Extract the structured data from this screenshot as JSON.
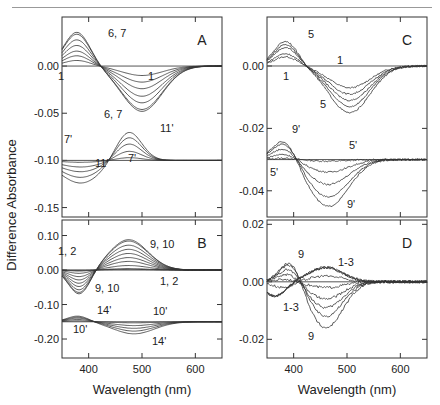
{
  "figure": {
    "ylabel": "Difference Absorbance",
    "xlabel": "Wavelength (nm)"
  },
  "chart_data": [
    {
      "panel": "A",
      "type": "line",
      "xlabel": "Wavelength (nm)",
      "ylabel": "Difference Absorbance",
      "xlim": [
        350,
        650
      ],
      "ylim": [
        -0.16,
        0.052
      ],
      "xticks": [
        400,
        500,
        600
      ],
      "yticks": [
        0.0,
        -0.05,
        -0.1,
        -0.15
      ],
      "ytick_labels": [
        "0.00",
        "-0.05",
        "-0.10",
        "-0.15"
      ],
      "baselines": [
        0.0,
        -0.1
      ],
      "groups": [
        {
          "name": "spectra 1 to 7",
          "offset": 0.0,
          "series": [
            {
              "name": "1",
              "peak_nm": 378,
              "peak": 0.006,
              "trough_nm": 500,
              "trough": -0.01
            },
            {
              "name": "2",
              "peak_nm": 378,
              "peak": 0.011,
              "trough_nm": 500,
              "trough": -0.017
            },
            {
              "name": "3",
              "peak_nm": 378,
              "peak": 0.016,
              "trough_nm": 500,
              "trough": -0.024
            },
            {
              "name": "4",
              "peak_nm": 378,
              "peak": 0.022,
              "trough_nm": 500,
              "trough": -0.032
            },
            {
              "name": "5",
              "peak_nm": 378,
              "peak": 0.028,
              "trough_nm": 500,
              "trough": -0.039
            },
            {
              "name": "6",
              "peak_nm": 378,
              "peak": 0.034,
              "trough_nm": 500,
              "trough": -0.046
            },
            {
              "name": "7",
              "peak_nm": 378,
              "peak": 0.036,
              "trough_nm": 500,
              "trough": -0.048
            }
          ]
        },
        {
          "name": "spectra 7' to 11'",
          "offset": -0.1,
          "series": [
            {
              "name": "7'",
              "trough_nm": 385,
              "trough": -0.002,
              "peak_nm": 475,
              "peak": 0.003
            },
            {
              "name": "8'",
              "trough_nm": 385,
              "trough": -0.007,
              "peak_nm": 475,
              "peak": 0.01
            },
            {
              "name": "9'",
              "trough_nm": 385,
              "trough": -0.012,
              "peak_nm": 475,
              "peak": 0.018
            },
            {
              "name": "10'",
              "trough_nm": 385,
              "trough": -0.018,
              "peak_nm": 475,
              "peak": 0.025
            },
            {
              "name": "11'",
              "trough_nm": 385,
              "trough": -0.024,
              "peak_nm": 475,
              "peak": 0.031
            }
          ]
        }
      ],
      "annotations": [
        "6, 7",
        "1",
        "1",
        "6, 7",
        "7'",
        "11'",
        "11'",
        "7'"
      ]
    },
    {
      "panel": "B",
      "type": "line",
      "xlabel": "Wavelength (nm)",
      "ylabel": "Difference Absorbance",
      "xlim": [
        350,
        650
      ],
      "ylim": [
        -0.255,
        0.145
      ],
      "xticks": [
        400,
        500,
        600
      ],
      "xtick_labels": [
        "400",
        "500",
        "600"
      ],
      "yticks": [
        0.1,
        0.0,
        -0.1,
        -0.2
      ],
      "ytick_labels": [
        "0.10",
        "0.00",
        "-0.10",
        "-0.20"
      ],
      "baselines": [
        0.0,
        -0.15
      ],
      "groups": [
        {
          "name": "spectra 1 to 10",
          "offset": 0.0,
          "series": [
            {
              "name": "1",
              "trough_nm": 383,
              "trough": -0.001,
              "peak_nm": 475,
              "peak": 0.002
            },
            {
              "name": "2",
              "trough_nm": 383,
              "trough": -0.003,
              "peak_nm": 475,
              "peak": 0.004
            },
            {
              "name": "3",
              "trough_nm": 383,
              "trough": -0.01,
              "peak_nm": 475,
              "peak": 0.013
            },
            {
              "name": "4",
              "trough_nm": 383,
              "trough": -0.02,
              "peak_nm": 475,
              "peak": 0.025
            },
            {
              "name": "5",
              "trough_nm": 383,
              "trough": -0.03,
              "peak_nm": 475,
              "peak": 0.036
            },
            {
              "name": "6",
              "trough_nm": 383,
              "trough": -0.04,
              "peak_nm": 475,
              "peak": 0.048
            },
            {
              "name": "7",
              "trough_nm": 383,
              "trough": -0.05,
              "peak_nm": 475,
              "peak": 0.06
            },
            {
              "name": "8",
              "trough_nm": 383,
              "trough": -0.06,
              "peak_nm": 475,
              "peak": 0.072
            },
            {
              "name": "9",
              "trough_nm": 383,
              "trough": -0.068,
              "peak_nm": 475,
              "peak": 0.084
            },
            {
              "name": "10",
              "trough_nm": 383,
              "trough": -0.072,
              "peak_nm": 475,
              "peak": 0.088
            }
          ]
        },
        {
          "name": "spectra 10' to 14'",
          "offset": -0.15,
          "series": [
            {
              "name": "10'",
              "peak_nm": 380,
              "peak": 0.003,
              "trough_nm": 485,
              "trough": -0.003
            },
            {
              "name": "11'",
              "peak_nm": 380,
              "peak": 0.007,
              "trough_nm": 485,
              "trough": -0.011
            },
            {
              "name": "12'",
              "peak_nm": 380,
              "peak": 0.011,
              "trough_nm": 485,
              "trough": -0.019
            },
            {
              "name": "13'",
              "peak_nm": 380,
              "peak": 0.014,
              "trough_nm": 485,
              "trough": -0.027
            },
            {
              "name": "14'",
              "peak_nm": 380,
              "peak": 0.017,
              "trough_nm": 485,
              "trough": -0.035
            }
          ]
        }
      ],
      "annotations": [
        "9, 10",
        "1, 2",
        "9, 10",
        "1, 2",
        "14'",
        "10'",
        "10'",
        "14'"
      ]
    },
    {
      "panel": "C",
      "type": "line",
      "xlabel": "Wavelength (nm)",
      "ylabel": "Difference Absorbance",
      "xlim": [
        350,
        650
      ],
      "ylim": [
        -0.0484,
        0.0157
      ],
      "xticks": [
        400,
        500,
        600
      ],
      "yticks": [
        0.0,
        -0.02,
        -0.04
      ],
      "ytick_labels": [
        "0.00",
        "-0.02",
        "-0.04"
      ],
      "baselines": [
        0.0,
        -0.03
      ],
      "groups": [
        {
          "name": "spectra 1 to 5",
          "offset": 0.0,
          "series": [
            {
              "name": "1",
              "peak_nm": 385,
              "peak": 0.003,
              "trough_nm": 505,
              "trough": -0.007
            },
            {
              "name": "2",
              "peak_nm": 385,
              "peak": 0.004,
              "trough_nm": 505,
              "trough": -0.009
            },
            {
              "name": "3",
              "peak_nm": 385,
              "peak": 0.006,
              "trough_nm": 505,
              "trough": -0.011
            },
            {
              "name": "4",
              "peak_nm": 385,
              "peak": 0.007,
              "trough_nm": 505,
              "trough": -0.013
            },
            {
              "name": "5",
              "peak_nm": 385,
              "peak": 0.008,
              "trough_nm": 505,
              "trough": -0.015
            }
          ]
        },
        {
          "name": "spectra 5' to 9'",
          "offset": -0.03,
          "series": [
            {
              "name": "5'",
              "peak_nm": 383,
              "peak": 0.0005,
              "trough_nm": 465,
              "trough": -0.0005
            },
            {
              "name": "6'",
              "peak_nm": 383,
              "peak": 0.002,
              "trough_nm": 465,
              "trough": -0.004
            },
            {
              "name": "7'",
              "peak_nm": 383,
              "peak": 0.004,
              "trough_nm": 465,
              "trough": -0.008
            },
            {
              "name": "8'",
              "peak_nm": 383,
              "peak": 0.006,
              "trough_nm": 465,
              "trough": -0.012
            },
            {
              "name": "9'",
              "peak_nm": 383,
              "peak": 0.007,
              "trough_nm": 465,
              "trough": -0.015
            }
          ]
        }
      ],
      "annotations": [
        "5",
        "1",
        "1",
        "5",
        "9'",
        "5'",
        "5'",
        "9'"
      ]
    },
    {
      "panel": "D",
      "type": "line",
      "xlabel": "Wavelength (nm)",
      "ylabel": "Difference Absorbance",
      "xlim": [
        350,
        650
      ],
      "ylim": [
        -0.0265,
        0.0215
      ],
      "xticks": [
        400,
        500,
        600
      ],
      "xtick_labels": [
        "400",
        "500",
        "600"
      ],
      "yticks": [
        0.02,
        0.0,
        -0.02
      ],
      "ytick_labels": [
        "0.02",
        "0.00",
        "-0.02"
      ],
      "baselines": [
        0.0
      ],
      "groups": [
        {
          "name": "spectra 1 to 9",
          "offset": 0.0,
          "series": [
            {
              "name": "1",
              "a_nm": 365,
              "a": -0.005,
              "b_nm": 460,
              "b": 0.005
            },
            {
              "name": "2",
              "a_nm": 365,
              "a": -0.005,
              "b_nm": 460,
              "b": 0.005
            },
            {
              "name": "3",
              "a_nm": 365,
              "a": -0.005,
              "b_nm": 460,
              "b": 0.005
            },
            {
              "name": "4",
              "a_nm": 380,
              "a": -0.002,
              "b_nm": 460,
              "b": 0.002
            },
            {
              "name": "5",
              "a_nm": 385,
              "a": 0.001,
              "b_nm": 460,
              "b": -0.002
            },
            {
              "name": "6",
              "a_nm": 390,
              "a": 0.003,
              "b_nm": 460,
              "b": -0.006
            },
            {
              "name": "7",
              "a_nm": 392,
              "a": 0.005,
              "b_nm": 460,
              "b": -0.009
            },
            {
              "name": "8",
              "a_nm": 395,
              "a": 0.007,
              "b_nm": 460,
              "b": -0.012
            },
            {
              "name": "9",
              "a_nm": 395,
              "a": 0.008,
              "b_nm": 460,
              "b": -0.016
            }
          ]
        }
      ],
      "annotations": [
        "9",
        "1-3",
        "1-3",
        "9"
      ]
    }
  ]
}
